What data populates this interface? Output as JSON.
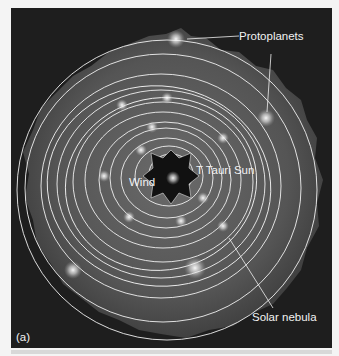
{
  "figure": {
    "panel_label": "(a)",
    "labels": {
      "protoplanets": "Protoplanets",
      "t_tauri_sun": "T Tauri Sun",
      "wind": "Wind",
      "solar_nebula": "Solar nebula"
    },
    "colors": {
      "background": "#1e1e1e",
      "nebula": "#5a5a5a",
      "orbit": "#f0f0f0",
      "glow": "#ffffff"
    }
  }
}
